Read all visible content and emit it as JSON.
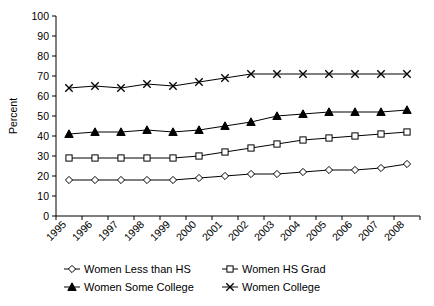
{
  "chart_data": {
    "type": "line",
    "title": "",
    "xlabel": "",
    "ylabel": "Percent",
    "ylim": [
      0,
      100
    ],
    "ytick_step": 10,
    "grid": false,
    "legend_position": "bottom",
    "categories": [
      "1995",
      "1996",
      "1997",
      "1998",
      "1999",
      "2000",
      "2001",
      "2002",
      "2003",
      "2004",
      "2005",
      "2006",
      "2007",
      "2008"
    ],
    "yticks": [
      "0",
      "10",
      "20",
      "30",
      "40",
      "50",
      "60",
      "70",
      "80",
      "90",
      "100"
    ],
    "series": [
      {
        "name": "Women Less than HS",
        "marker": "diamond-open",
        "values": [
          18,
          18,
          18,
          18,
          18,
          19,
          20,
          21,
          21,
          22,
          23,
          23,
          24,
          26
        ]
      },
      {
        "name": "Women HS Grad",
        "marker": "square-open",
        "values": [
          29,
          29,
          29,
          29,
          29,
          30,
          32,
          34,
          36,
          38,
          39,
          40,
          41,
          42
        ]
      },
      {
        "name": "Women Some College",
        "marker": "triangle-filled",
        "values": [
          41,
          42,
          42,
          43,
          42,
          43,
          45,
          47,
          50,
          51,
          52,
          52,
          52,
          53
        ]
      },
      {
        "name": "Women College",
        "marker": "x",
        "values": [
          64,
          65,
          64,
          66,
          65,
          67,
          69,
          71,
          71,
          71,
          71,
          71,
          71,
          71
        ]
      }
    ]
  },
  "legend": {
    "items": [
      {
        "label": "Women Less than HS",
        "marker": "diamond-open"
      },
      {
        "label": "Women HS Grad",
        "marker": "square-open"
      },
      {
        "label": "Women Some College",
        "marker": "triangle-filled"
      },
      {
        "label": "Women College",
        "marker": "x"
      }
    ]
  },
  "colors": {
    "ink": "#000000",
    "background": "#ffffff",
    "marker_fill": "#ffffff"
  }
}
